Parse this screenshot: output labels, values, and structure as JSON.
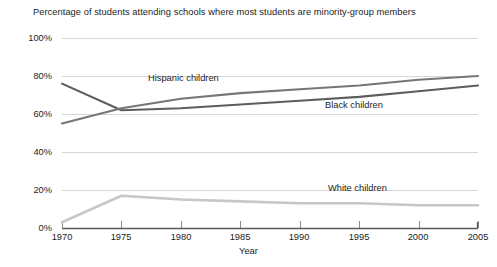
{
  "chart_data": {
    "type": "line",
    "title": "Percentage of students attending schools where most students are minority-group members",
    "xlabel": "Year",
    "ylabel": "",
    "xlim": [
      1970,
      2005
    ],
    "ylim": [
      0,
      100
    ],
    "grid": true,
    "legend_position": "inline-annotations",
    "x_ticks": [
      1970,
      1975,
      1980,
      1985,
      1990,
      1995,
      2000,
      2005
    ],
    "x_tick_labels": [
      "1970",
      "1975",
      "1980",
      "1985",
      "1990",
      "1995",
      "2000",
      "2005"
    ],
    "y_ticks": [
      0,
      20,
      40,
      60,
      80,
      100
    ],
    "y_tick_labels": [
      "0%",
      "20%",
      "40%",
      "60%",
      "80%",
      "100%"
    ],
    "x": [
      1970,
      1975,
      1980,
      1985,
      1990,
      1995,
      2000,
      2005
    ],
    "series": [
      {
        "name": "Black children",
        "label": "Black children",
        "color": "#5d5d5d",
        "values": [
          76,
          62,
          63,
          65,
          67,
          69,
          72,
          75
        ]
      },
      {
        "name": "Hispanic children",
        "label": "Hispanic children",
        "color": "#767676",
        "values": [
          55,
          63,
          68,
          71,
          73,
          75,
          78,
          80
        ]
      },
      {
        "name": "White children",
        "label": "White children",
        "color": "#c7c7c7",
        "values": [
          3,
          17,
          15,
          14,
          13,
          13,
          12,
          12
        ]
      }
    ]
  },
  "axis": {
    "baseline_color": "#5a5a5a",
    "gridline_color": "#d6d6d6"
  }
}
